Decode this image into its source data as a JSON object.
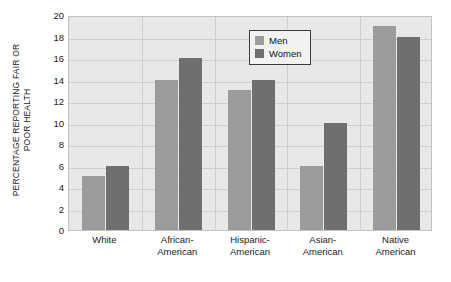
{
  "chart_data": {
    "type": "bar",
    "title": "",
    "xlabel": "",
    "ylabel": "PERCENTAGE REPORTING FAIR OR POOR HEALTH",
    "ylabel_lines": [
      "PERCENTAGE REPORTING FAIR OR",
      "POOR HEALTH"
    ],
    "categories": [
      "White",
      "African-American",
      "Hispanic-American",
      "Asian-American",
      "Native American"
    ],
    "category_lines": [
      [
        "White"
      ],
      [
        "African-",
        "American"
      ],
      [
        "Hispanic-",
        "American"
      ],
      [
        "Asian-",
        "American"
      ],
      [
        "Native",
        "American"
      ]
    ],
    "series": [
      {
        "name": "Men",
        "color": "#9b9b9b",
        "values": [
          5,
          14,
          13,
          6,
          19
        ]
      },
      {
        "name": "Women",
        "color": "#6f6f6f",
        "values": [
          6,
          16,
          14,
          10,
          18
        ]
      }
    ],
    "ylim": [
      0,
      20
    ],
    "ytick_step": 2,
    "yticks": [
      20,
      18,
      16,
      14,
      12,
      10,
      8,
      6,
      4,
      2,
      0
    ],
    "grid": true,
    "grid_axis": "both",
    "legend_position": "top-center-right"
  },
  "legend": {
    "entries": [
      {
        "label": "Men",
        "color": "#9b9b9b"
      },
      {
        "label": "Women",
        "color": "#6f6f6f"
      }
    ]
  },
  "colors": {
    "plot_background": "#e8e8e8",
    "page_background": "#ffffff",
    "gridline": "#cfcfcf",
    "frame": "#c2c2c2",
    "text": "#1a1a1a",
    "men_bar": "#9b9b9b",
    "women_bar": "#6f6f6f"
  }
}
